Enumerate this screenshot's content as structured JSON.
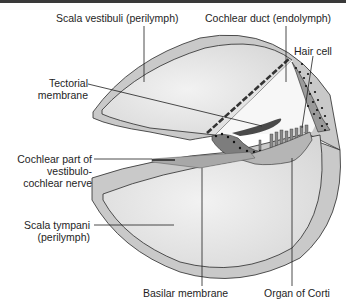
{
  "figure": {
    "colors": {
      "outer_wall": "#c9c9c9",
      "chamber_fill": "#e4e4e4",
      "outline": "#2a2a2a",
      "tissue_dark": "#7d7d7d",
      "tectorial": "#4a4a4a",
      "dots": "#111111",
      "top_rule": "#3a3a3a"
    }
  },
  "labels": {
    "scala_vestibuli": "Scala vestibuli (perilymph)",
    "cochlear_duct": "Cochlear duct (endolymph)",
    "hair_cell": "Hair cell",
    "tectorial_line1": "Tectorial",
    "tectorial_line2": "membrane",
    "nerve_line1": "Cochlear part of",
    "nerve_line2": "vestibulo-",
    "nerve_line3": "cochlear nerve",
    "scala_tympani_line1": "Scala tympani",
    "scala_tympani_line2": "(perilymph)",
    "basilar_membrane": "Basilar membrane",
    "organ_of_corti": "Organ of Corti"
  }
}
